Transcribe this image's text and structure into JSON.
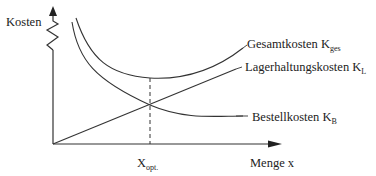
{
  "diagram": {
    "y_axis_label": "Kosten",
    "x_axis_label": "Menge x",
    "x_marker": {
      "main": "X",
      "sub": "opt."
    },
    "curves": [
      {
        "id": "gesamtkosten",
        "label_main": "Gesamtkosten K",
        "label_sub": "ges",
        "shape": "u-shaped"
      },
      {
        "id": "lagerhaltungskosten",
        "label_main": "Lagerhaltungskosten K",
        "label_sub": "L",
        "shape": "linear-increasing"
      },
      {
        "id": "bestellkosten",
        "label_main": "Bestellkosten K",
        "label_sub": "B",
        "shape": "hyperbolic-decreasing"
      }
    ],
    "annotations": {
      "optimum_line": "dashed vertical at minimum of total cost, intersection of K_L and K_B"
    },
    "colors": {
      "line": "#333333",
      "text": "#222222",
      "background": "#ffffff"
    }
  }
}
